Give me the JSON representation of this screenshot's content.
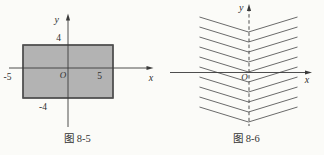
{
  "page": {
    "background": "#fbfbf8"
  },
  "figure_left": {
    "caption": "图 8-5",
    "labels": {
      "y_axis": "y",
      "x_axis": "x",
      "origin": "O",
      "tick_top": "4",
      "tick_bottom": "-4",
      "tick_left": "-5",
      "tick_right": "5"
    },
    "rect": {
      "x_range": [
        -5,
        5
      ],
      "y_range": [
        -4,
        4
      ],
      "fill_color": "#b3b3b3",
      "stroke_color": "#4d4d4d"
    },
    "axis_color": "#3a3a3a"
  },
  "figure_right": {
    "caption": "图 8-6",
    "labels": {
      "y_axis": "y",
      "x_axis": "x",
      "origin": "O"
    },
    "chevrons": {
      "count": 10,
      "vertex_x": 248.5,
      "first_vertex_y": 32,
      "spacing": 10,
      "arm_dx": 49,
      "arm_dy": 15,
      "direction": "downward-V"
    },
    "line_color": "#6b6b6b",
    "axis_color": "#3a3a3a"
  }
}
